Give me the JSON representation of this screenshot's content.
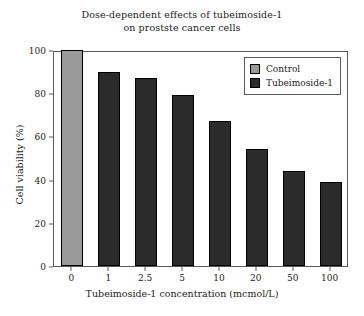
{
  "chart_data": {
    "type": "bar",
    "title": "Dose-dependent effects of tubeimoside-1 on prostste cancer cells",
    "title_lines": [
      "Dose-dependent effects of tubeimoside-1",
      "on prostste cancer cells"
    ],
    "xlabel": "Tubeimoside-1 concentration (mcmol/L)",
    "ylabel": "Cell viability (%)",
    "categories": [
      "0",
      "1",
      "2.5",
      "5",
      "10",
      "20",
      "50",
      "100"
    ],
    "values": [
      100,
      90,
      87,
      79,
      67,
      54,
      44,
      39
    ],
    "groups": [
      "Control",
      "Tubeimoside-1",
      "Tubeimoside-1",
      "Tubeimoside-1",
      "Tubeimoside-1",
      "Tubeimoside-1",
      "Tubeimoside-1",
      "Tubeimoside-1"
    ],
    "ylim": [
      0,
      100
    ],
    "yticks": [
      0,
      20,
      40,
      60,
      80,
      100
    ],
    "ytick_labels": [
      "0",
      "20",
      "40",
      "60",
      "80",
      "100"
    ],
    "grid": false,
    "legend_position": "upper-right",
    "legend": [
      {
        "label": "Control",
        "color": "#9a9a9a"
      },
      {
        "label": "Tubeimoside-1",
        "color": "#2b2b2b"
      }
    ],
    "colors": {
      "control": "#9a9a9a",
      "treatment": "#2b2b2b",
      "axis": "#5a5a5a",
      "text": "#1d1d1d",
      "background": "#ffffff"
    }
  }
}
